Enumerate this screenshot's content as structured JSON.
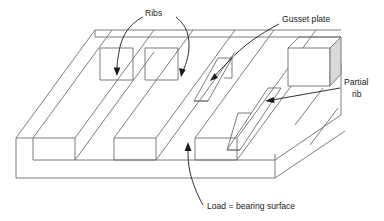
{
  "figure": {
    "type": "engineering-line-diagram",
    "background_color": "#ffffff",
    "line_color": "#6e6e6e",
    "leader_color": "#1a1a1a",
    "shade_color": "#d9d9d9"
  },
  "labels": {
    "ribs": "Ribs",
    "gusset_plate": "Gusset plate",
    "partial_rib_line1": "Partial",
    "partial_rib_line2": "rib",
    "load_bearing_surface": "Load = bearing surface"
  },
  "annotations": [
    {
      "id": "ribs",
      "text": "Ribs",
      "leader_count": 2,
      "points_to": [
        "first-full-rib",
        "third-full-rib"
      ]
    },
    {
      "id": "gusset-plate",
      "text": "Gusset plate",
      "leader_count": 1,
      "points_to": [
        "tapered-gusset-plate"
      ]
    },
    {
      "id": "partial-rib",
      "text": "Partial rib",
      "leader_count": 1,
      "points_to": [
        "short-partial-rib"
      ]
    },
    {
      "id": "load-bearing-surface",
      "text": "Load = bearing surface",
      "leader_count": 1,
      "points_to": [
        "top-base-plate-surface"
      ]
    }
  ],
  "parts": [
    {
      "name": "base-plate",
      "description": "flat rectangular plate forming the load = bearing surface"
    },
    {
      "name": "full-rib-1",
      "description": "full-height longitudinal rib"
    },
    {
      "name": "full-rib-2",
      "description": "full-height longitudinal rib"
    },
    {
      "name": "full-rib-3",
      "description": "full-height longitudinal rib"
    },
    {
      "name": "gusset-plate-1",
      "description": "tapered triangular gusset plate"
    },
    {
      "name": "gusset-plate-2",
      "description": "tapered triangular gusset plate"
    },
    {
      "name": "partial-rib",
      "description": "shortened rib at right end, does not run full length"
    },
    {
      "name": "end-block",
      "description": "solid rectangular end block with shaded right face"
    }
  ]
}
